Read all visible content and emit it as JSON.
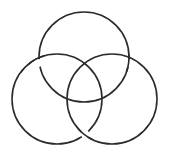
{
  "diagram": {
    "title": "Borromean rings",
    "stroke_color": "#2b2b2b",
    "background": "#ffffff",
    "stroke_width": 1.6,
    "rings": [
      {
        "name": "top",
        "cx": 84,
        "cy": 57,
        "r": 45
      },
      {
        "name": "left",
        "cx": 57,
        "cy": 99,
        "r": 45
      },
      {
        "name": "right",
        "cx": 112,
        "cy": 99,
        "r": 45
      }
    ],
    "crossings": [
      {
        "at": [
          38,
          63
        ],
        "over": "left",
        "under": "top"
      },
      {
        "at": [
          129,
          63
        ],
        "over": "top",
        "under": "right"
      },
      {
        "at": [
          85,
          134
        ],
        "over": "right",
        "under": "left"
      }
    ]
  }
}
